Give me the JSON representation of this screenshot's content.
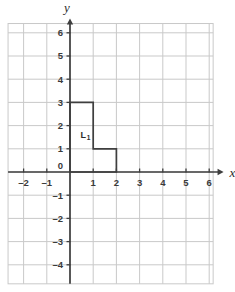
{
  "figure": {
    "background_color": "#ffffff",
    "grid_color": "#c9c9c9",
    "axis_color": "#3f3f3f",
    "shape_color": "#3f3f3f",
    "label_color": "#3a3a3a"
  },
  "chart_data": {
    "type": "scatter",
    "title": "",
    "xlabel": "x",
    "ylabel": "y",
    "grid": true,
    "legend": null,
    "xlim": [
      -2.6,
      6.9
    ],
    "ylim": [
      -4.8,
      6.9
    ],
    "xticks": [
      -2,
      -1,
      0,
      1,
      2,
      3,
      4,
      5,
      6
    ],
    "yticks": [
      6,
      5,
      4,
      3,
      2,
      1,
      -1,
      -2,
      -3,
      -4
    ],
    "xtick_labels": [
      "-2",
      "-1",
      "0",
      "1",
      "2",
      "3",
      "4",
      "5",
      "6"
    ],
    "ytick_labels": [
      "6",
      "5",
      "4",
      "3",
      "2",
      "1",
      "-1",
      "-2",
      "-3",
      "-4"
    ],
    "origin_label": "0",
    "grid_step": 1,
    "shapes": [
      {
        "name": "L1",
        "label": "L",
        "label_subscript": "1",
        "label_position": [
          0.45,
          1.45
        ],
        "closed": true,
        "vertices": [
          [
            0,
            0
          ],
          [
            0,
            3
          ],
          [
            1,
            3
          ],
          [
            1,
            1
          ],
          [
            2,
            1
          ],
          [
            2,
            0
          ]
        ]
      }
    ]
  },
  "axes": {
    "x_axis_name": "x",
    "y_axis_name": "y"
  }
}
